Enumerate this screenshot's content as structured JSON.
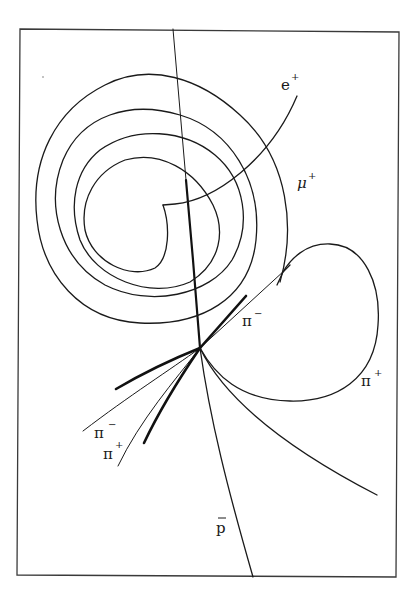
{
  "diagram": {
    "type": "bubble-chamber-track-sketch",
    "colors": {
      "background": "#ffffff",
      "ink": "#1a1a1a",
      "frame": "#3a3a3a"
    },
    "frame": {
      "top_left": [
        20,
        29
      ],
      "top_right": [
        399,
        32
      ],
      "bottom_right": [
        396,
        577
      ],
      "bottom_left": [
        17,
        575
      ]
    },
    "vertex": [
      200,
      348
    ],
    "labels": {
      "e_plus": {
        "base": "e",
        "sup": "+"
      },
      "mu_plus": {
        "base": "μ",
        "sup": "+"
      },
      "pi_minus_upper": {
        "base": "π",
        "sup": "−"
      },
      "pi_plus_right": {
        "base": "π",
        "sup": "+"
      },
      "pi_minus_lower": {
        "base": "π",
        "sup": "−"
      },
      "pi_plus_lower": {
        "base": "π",
        "sup": "+"
      },
      "antiproton": {
        "base": "p",
        "overbar": true
      }
    },
    "tracks": [
      {
        "id": "incoming-beam",
        "description": "Nearly straight track entering from top, ending at vertex (thickens near vertex)"
      },
      {
        "id": "antiproton",
        "label": "p̄",
        "description": "Slightly curved track from vertex to bottom edge"
      },
      {
        "id": "pi-plus-loop",
        "label": "π+",
        "description": "Track curving right from vertex into large loop, ending in decay kink"
      },
      {
        "id": "mu-plus",
        "label": "μ+",
        "description": "Decay muon from kink looping upward into spiral around left"
      },
      {
        "id": "e-plus",
        "label": "e+",
        "description": "Positron leaving spiral centre, curving up to the right"
      },
      {
        "id": "pi-minus-upper",
        "label": "π−",
        "description": "Track from vertex up-right, with thick segment"
      },
      {
        "id": "pi-minus-lower",
        "label": "π−",
        "description": "Thin track from vertex to lower left"
      },
      {
        "id": "pi-plus-lower",
        "label": "π+",
        "description": "Thin track from vertex to lower left"
      },
      {
        "id": "right-lower-curve",
        "description": "Unlabelled track curving from vertex down-right"
      },
      {
        "id": "thick-lower-left",
        "description": "Two short heavy-ionising stubs to lower left"
      }
    ]
  }
}
